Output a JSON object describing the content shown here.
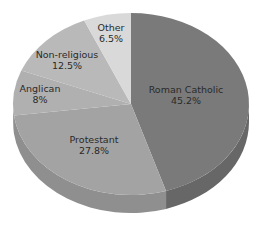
{
  "chart_data": {
    "type": "pie",
    "title": "",
    "style": "3d",
    "start_angle": "12 o'clock",
    "direction": "clockwise",
    "categories": [
      "Roman Catholic",
      "Protestant",
      "Anglican",
      "Non-religious",
      "Other"
    ],
    "values": [
      45.2,
      27.8,
      8,
      12.5,
      6.5
    ],
    "unit": "%",
    "labels": [
      {
        "name": "Roman Catholic",
        "value": "45.2%"
      },
      {
        "name": "Protestant",
        "value": "27.8%"
      },
      {
        "name": "Anglican",
        "value": "8%"
      },
      {
        "name": "Non-religious",
        "value": "12.5%"
      },
      {
        "name": "Other",
        "value": "6.5%"
      }
    ],
    "colors": [
      "#7a7a7a",
      "#a3a3a3",
      "#b0b0b0",
      "#b9b9b9",
      "#d9d9d9"
    ],
    "side_colors": [
      "#676767",
      "#8f8f8f",
      "#9c9c9c",
      "#a5a5a5",
      "#c4c4c4"
    ],
    "legend": "none",
    "grid": false
  }
}
